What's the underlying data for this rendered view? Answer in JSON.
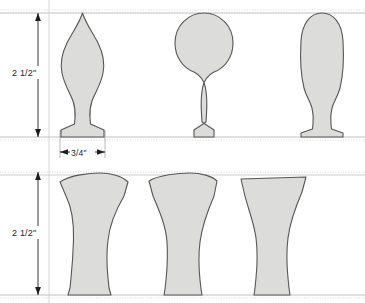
{
  "drawing": {
    "title": "Turned Profile Patterns",
    "background_color": "#ffffff",
    "shape_fill_color": "#dcdcda",
    "shape_stroke_color": "#565656",
    "guide_line_color": "#b8b8b8",
    "dimension_line_color": "#1d1d1d",
    "units": "inches"
  },
  "dimensions": {
    "top_row_height": {
      "label": "2 1/2\"",
      "orientation": "vertical",
      "value": 2.5,
      "unit": "in"
    },
    "bottom_row_height": {
      "label": "2 1/2\"",
      "orientation": "vertical",
      "value": 2.5,
      "unit": "in"
    },
    "base_width": {
      "label": "3/4\"",
      "orientation": "horizontal",
      "value": 0.75,
      "unit": "in"
    }
  },
  "rows": [
    {
      "name": "finials",
      "row_label": "Top row - finial profiles",
      "height_label": "2 1/2\"",
      "shapes": [
        {
          "name": "pointed-flame-finial",
          "index": 1
        },
        {
          "name": "round-ball-finial",
          "index": 2
        },
        {
          "name": "elongated-oval-finial",
          "index": 3
        }
      ]
    },
    {
      "name": "legs",
      "row_label": "Bottom row - tapered leg profiles",
      "height_label": "2 1/2\"",
      "shapes": [
        {
          "name": "flared-waisted-leg",
          "index": 1
        },
        {
          "name": "shouldered-tapered-leg",
          "index": 2
        },
        {
          "name": "flat-top-flared-leg",
          "index": 3
        }
      ]
    }
  ],
  "guides": {
    "top_row_top_y": 13,
    "top_row_base_y": 137,
    "bottom_row_top_y": 172,
    "bottom_row_base_y": 295
  }
}
